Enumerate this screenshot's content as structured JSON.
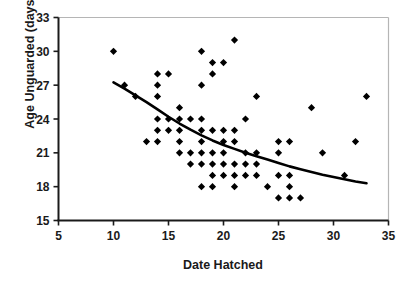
{
  "chart_data": {
    "type": "scatter",
    "title": "",
    "xlabel": "Date Hatched",
    "ylabel": "Age Unguarded (days)",
    "xlim": [
      5,
      35
    ],
    "ylim": [
      15,
      33
    ],
    "xticks": [
      5,
      10,
      15,
      20,
      25,
      30,
      35
    ],
    "yticks": [
      15,
      18,
      21,
      24,
      27,
      30,
      33
    ],
    "grid": false,
    "legend": null,
    "marker": "diamond",
    "marker_color": "#000000",
    "points": [
      {
        "x": 10,
        "y": 30
      },
      {
        "x": 11,
        "y": 27
      },
      {
        "x": 12,
        "y": 26
      },
      {
        "x": 13,
        "y": 22
      },
      {
        "x": 14,
        "y": 28
      },
      {
        "x": 14,
        "y": 27
      },
      {
        "x": 14,
        "y": 26
      },
      {
        "x": 14,
        "y": 24
      },
      {
        "x": 14,
        "y": 23
      },
      {
        "x": 14,
        "y": 22
      },
      {
        "x": 15,
        "y": 28
      },
      {
        "x": 15,
        "y": 24
      },
      {
        "x": 15,
        "y": 23
      },
      {
        "x": 16,
        "y": 25
      },
      {
        "x": 16,
        "y": 24
      },
      {
        "x": 16,
        "y": 23
      },
      {
        "x": 16,
        "y": 22
      },
      {
        "x": 16,
        "y": 21
      },
      {
        "x": 17,
        "y": 24
      },
      {
        "x": 17,
        "y": 21
      },
      {
        "x": 17,
        "y": 20
      },
      {
        "x": 18,
        "y": 30
      },
      {
        "x": 18,
        "y": 27
      },
      {
        "x": 18,
        "y": 24
      },
      {
        "x": 18,
        "y": 23
      },
      {
        "x": 18,
        "y": 22
      },
      {
        "x": 18,
        "y": 21
      },
      {
        "x": 18,
        "y": 20
      },
      {
        "x": 18,
        "y": 18
      },
      {
        "x": 19,
        "y": 29
      },
      {
        "x": 19,
        "y": 28
      },
      {
        "x": 19,
        "y": 23
      },
      {
        "x": 19,
        "y": 21
      },
      {
        "x": 19,
        "y": 20
      },
      {
        "x": 19,
        "y": 19
      },
      {
        "x": 19,
        "y": 18
      },
      {
        "x": 20,
        "y": 29
      },
      {
        "x": 20,
        "y": 23
      },
      {
        "x": 20,
        "y": 22
      },
      {
        "x": 20,
        "y": 21
      },
      {
        "x": 20,
        "y": 20
      },
      {
        "x": 20,
        "y": 19
      },
      {
        "x": 21,
        "y": 31
      },
      {
        "x": 21,
        "y": 23
      },
      {
        "x": 21,
        "y": 22
      },
      {
        "x": 21,
        "y": 20
      },
      {
        "x": 21,
        "y": 19
      },
      {
        "x": 21,
        "y": 18
      },
      {
        "x": 22,
        "y": 24
      },
      {
        "x": 22,
        "y": 21
      },
      {
        "x": 22,
        "y": 20
      },
      {
        "x": 22,
        "y": 19
      },
      {
        "x": 23,
        "y": 26
      },
      {
        "x": 23,
        "y": 21
      },
      {
        "x": 23,
        "y": 20
      },
      {
        "x": 23,
        "y": 19
      },
      {
        "x": 24,
        "y": 18
      },
      {
        "x": 25,
        "y": 22
      },
      {
        "x": 25,
        "y": 21
      },
      {
        "x": 25,
        "y": 19
      },
      {
        "x": 25,
        "y": 17
      },
      {
        "x": 26,
        "y": 22
      },
      {
        "x": 26,
        "y": 19
      },
      {
        "x": 26,
        "y": 18
      },
      {
        "x": 26,
        "y": 17
      },
      {
        "x": 27,
        "y": 17
      },
      {
        "x": 28,
        "y": 25
      },
      {
        "x": 29,
        "y": 21
      },
      {
        "x": 31,
        "y": 19
      },
      {
        "x": 32,
        "y": 22
      },
      {
        "x": 33,
        "y": 26
      }
    ],
    "trend_line": {
      "type": "fitted-curve",
      "color": "#000000",
      "points": [
        {
          "x": 10.0,
          "y": 27.25
        },
        {
          "x": 11.0,
          "y": 26.7
        },
        {
          "x": 12.0,
          "y": 26.1
        },
        {
          "x": 13.0,
          "y": 25.5
        },
        {
          "x": 14.0,
          "y": 24.85
        },
        {
          "x": 15.0,
          "y": 24.2
        },
        {
          "x": 16.0,
          "y": 23.6
        },
        {
          "x": 17.0,
          "y": 23.05
        },
        {
          "x": 18.0,
          "y": 22.55
        },
        {
          "x": 19.0,
          "y": 22.1
        },
        {
          "x": 20.0,
          "y": 21.7
        },
        {
          "x": 21.0,
          "y": 21.35
        },
        {
          "x": 22.0,
          "y": 21.0
        },
        {
          "x": 23.0,
          "y": 20.7
        },
        {
          "x": 24.0,
          "y": 20.4
        },
        {
          "x": 25.0,
          "y": 20.1
        },
        {
          "x": 26.0,
          "y": 19.8
        },
        {
          "x": 27.0,
          "y": 19.55
        },
        {
          "x": 28.0,
          "y": 19.3
        },
        {
          "x": 29.0,
          "y": 19.05
        },
        {
          "x": 30.0,
          "y": 18.85
        },
        {
          "x": 31.0,
          "y": 18.65
        },
        {
          "x": 32.0,
          "y": 18.45
        },
        {
          "x": 33.0,
          "y": 18.3
        }
      ]
    }
  },
  "axis": {
    "x_tick_labels": [
      "5",
      "10",
      "15",
      "20",
      "25",
      "30",
      "35"
    ],
    "y_tick_labels": [
      "15",
      "18",
      "21",
      "24",
      "27",
      "30",
      "33"
    ],
    "x_title": "Date Hatched",
    "y_title": "Age Unguarded (days)"
  },
  "colors": {
    "marker": "#000000",
    "trend": "#000000",
    "axis": "#1a1a1a",
    "frame_light": "#b5b5b5",
    "background": "#ffffff"
  }
}
